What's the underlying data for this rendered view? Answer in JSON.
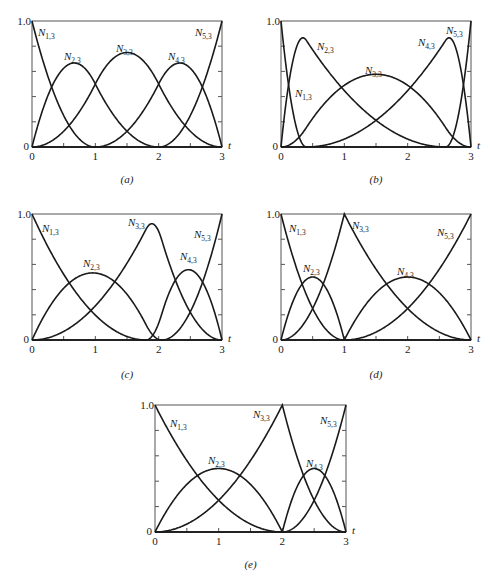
{
  "chart_data": [
    {
      "id": "a",
      "type": "line",
      "caption": "(a)",
      "frame": {
        "x0": 32,
        "y0": 21,
        "x1": 222,
        "y1": 147
      },
      "order": 3,
      "knots": [
        0,
        0,
        0,
        1,
        2,
        3,
        3,
        3
      ],
      "xlabel": "t",
      "xlim": [
        0,
        3
      ],
      "ylim": [
        0,
        1
      ],
      "xticks": [
        "0",
        "1",
        "2",
        "3"
      ],
      "yticks": [
        "0",
        "1.0"
      ],
      "series": [
        {
          "name": "N1,3",
          "label_pos": [
            38,
            36
          ]
        },
        {
          "name": "N2,3",
          "label_pos": [
            64,
            60
          ]
        },
        {
          "name": "N3,3",
          "label_pos": [
            116,
            52
          ]
        },
        {
          "name": "N4,3",
          "label_pos": [
            168,
            60
          ]
        },
        {
          "name": "N5,3",
          "label_pos": [
            195,
            36
          ]
        }
      ]
    },
    {
      "id": "b",
      "type": "line",
      "caption": "(b)",
      "frame": {
        "x0": 281,
        "y0": 21,
        "x1": 471,
        "y1": 147
      },
      "order": 3,
      "knots": [
        0,
        0,
        0,
        0.4,
        2.6,
        3,
        3,
        3
      ],
      "xlabel": "t",
      "xlim": [
        0,
        3
      ],
      "ylim": [
        0,
        1
      ],
      "xticks": [
        "0",
        "1",
        "2",
        "3"
      ],
      "yticks": [
        "0",
        "1.0"
      ],
      "series": [
        {
          "name": "N1,3",
          "label_pos": [
            295,
            97
          ]
        },
        {
          "name": "N2,3",
          "label_pos": [
            317,
            50
          ]
        },
        {
          "name": "N3,3",
          "label_pos": [
            365,
            74
          ]
        },
        {
          "name": "N4,3",
          "label_pos": [
            418,
            46
          ]
        },
        {
          "name": "N5,3",
          "label_pos": [
            446,
            34
          ]
        }
      ]
    },
    {
      "id": "c",
      "type": "line",
      "caption": "(c)",
      "frame": {
        "x0": 32,
        "y0": 214,
        "x1": 222,
        "y1": 340
      },
      "order": 3,
      "knots": [
        0,
        0,
        0,
        1.8,
        2.05,
        3,
        3,
        3
      ],
      "xlabel": "t",
      "xlim": [
        0,
        3
      ],
      "ylim": [
        0,
        1
      ],
      "xticks": [
        "0",
        "1",
        "2",
        "3"
      ],
      "yticks": [
        "0",
        "1.0"
      ],
      "series": [
        {
          "name": "N1,3",
          "label_pos": [
            42,
            232
          ]
        },
        {
          "name": "N2,3",
          "label_pos": [
            83,
            267
          ]
        },
        {
          "name": "N3,3",
          "label_pos": [
            128,
            226
          ]
        },
        {
          "name": "N4,3",
          "label_pos": [
            180,
            260
          ]
        },
        {
          "name": "N5,3",
          "label_pos": [
            194,
            238
          ]
        }
      ]
    },
    {
      "id": "d",
      "type": "line",
      "caption": "(d)",
      "frame": {
        "x0": 281,
        "y0": 214,
        "x1": 471,
        "y1": 340
      },
      "order": 3,
      "knots": [
        0,
        0,
        0,
        1,
        1,
        3,
        3,
        3
      ],
      "xlabel": "t",
      "xlim": [
        0,
        3
      ],
      "ylim": [
        0,
        1
      ],
      "xticks": [
        "0",
        "1",
        "2",
        "3"
      ],
      "yticks": [
        "0",
        "1.0"
      ],
      "series": [
        {
          "name": "N1,3",
          "label_pos": [
            289,
            232
          ]
        },
        {
          "name": "N2,3",
          "label_pos": [
            303,
            272
          ]
        },
        {
          "name": "N3,3",
          "label_pos": [
            352,
            229
          ]
        },
        {
          "name": "N4,3",
          "label_pos": [
            397,
            275
          ]
        },
        {
          "name": "N5,3",
          "label_pos": [
            437,
            236
          ]
        }
      ]
    },
    {
      "id": "e",
      "type": "line",
      "caption": "(e)",
      "frame": {
        "x0": 155,
        "y0": 405,
        "x1": 346,
        "y1": 532
      },
      "order": 3,
      "knots": [
        0,
        0,
        0,
        2,
        2,
        3,
        3,
        3
      ],
      "xlabel": "t",
      "xlim": [
        0,
        3
      ],
      "ylim": [
        0,
        1
      ],
      "xticks": [
        "0",
        "1",
        "2",
        "3"
      ],
      "yticks": [
        "0",
        "1.0"
      ],
      "series": [
        {
          "name": "N1,3",
          "label_pos": [
            170,
            427
          ]
        },
        {
          "name": "N2,3",
          "label_pos": [
            208,
            464
          ]
        },
        {
          "name": "N3,3",
          "label_pos": [
            253,
            418
          ]
        },
        {
          "name": "N4,3",
          "label_pos": [
            306,
            467
          ]
        },
        {
          "name": "N5,3",
          "label_pos": [
            320,
            424
          ]
        }
      ]
    }
  ],
  "caption_y": {
    "a": 183,
    "b": 183,
    "c": 378,
    "d": 378,
    "e": 568
  }
}
